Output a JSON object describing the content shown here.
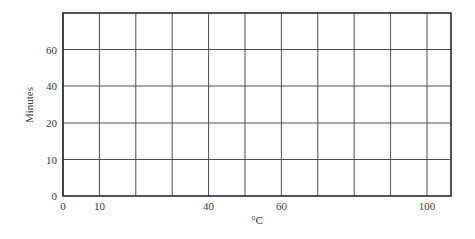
{
  "chart_data": {
    "type": "line",
    "title": "",
    "xlabel": "°C",
    "ylabel": "Minutes",
    "xlim": [
      0,
      106.6
    ],
    "x_ticks": [
      0,
      10,
      40,
      60,
      100
    ],
    "x_gridlines": [
      0,
      10,
      20,
      30,
      40,
      50,
      60,
      70,
      80,
      90,
      100
    ],
    "y_ticks": [
      0,
      10,
      20,
      40,
      60
    ],
    "y_gridline_labels": [
      "0",
      "10",
      "20",
      "40",
      "60"
    ],
    "y_note": "gridlines evenly spaced; labeled 0, 10, 20, 40, 60 (non-uniform scale)",
    "grid": true,
    "legend": null,
    "series": [],
    "annotations": []
  },
  "axes": {
    "x_label": "°C",
    "y_label": "Minutes",
    "x_tick_labels": [
      "0",
      "10",
      "40",
      "60",
      "100"
    ],
    "y_tick_labels": [
      "0",
      "10",
      "20",
      "40",
      "60"
    ]
  },
  "colors": {
    "grid": "#3c3c3c",
    "frame": "#2a2a2a",
    "text": "#3a3a3a",
    "background": "#ffffff"
  }
}
